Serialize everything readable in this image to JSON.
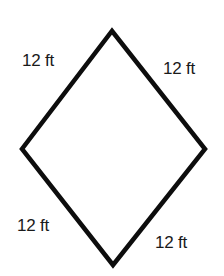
{
  "diagram": {
    "shape": "rhombus",
    "stroke_color": "#0d0d0d",
    "stroke_width": 4.5,
    "vertices": {
      "top": [
        112,
        31
      ],
      "right": [
        205,
        149
      ],
      "bottom": [
        113,
        265
      ],
      "left": [
        22,
        149
      ]
    },
    "side_labels": [
      {
        "id": "top-left",
        "text": "12 ft",
        "x": 22,
        "y": 52
      },
      {
        "id": "top-right",
        "text": "12 ft",
        "x": 163,
        "y": 60
      },
      {
        "id": "bottom-left",
        "text": "12 ft",
        "x": 17,
        "y": 217
      },
      {
        "id": "bottom-right",
        "text": "12 ft",
        "x": 155,
        "y": 234
      }
    ]
  }
}
